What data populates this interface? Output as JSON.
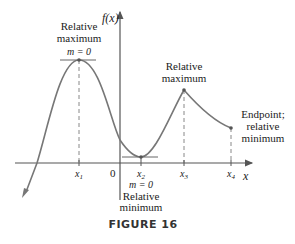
{
  "figure": {
    "caption": "FIGURE 16",
    "y_axis_label": "f(x)",
    "x_axis_label": "x",
    "origin_label": "0",
    "ticks": [
      "x1",
      "x2",
      "x3",
      "x4"
    ],
    "tick_display": {
      "x1": "x",
      "x1_sub": "1",
      "x2": "x",
      "x2_sub": "2",
      "x3": "x",
      "x3_sub": "3",
      "x4": "x",
      "x4_sub": "4"
    },
    "annotations": {
      "max1_line1": "Relative",
      "max1_line2": "maximum",
      "max1_slope": "m = 0",
      "min_slope": "m = 0",
      "min_line1": "Relative",
      "min_line2": "minimum",
      "max2_line1": "Relative",
      "max2_line2": "maximum",
      "end_line1": "Endpoint;",
      "end_line2": "relative",
      "end_line3": "minimum"
    },
    "colors": {
      "curve": "#777777",
      "axis": "#555555",
      "text": "#222222"
    }
  }
}
